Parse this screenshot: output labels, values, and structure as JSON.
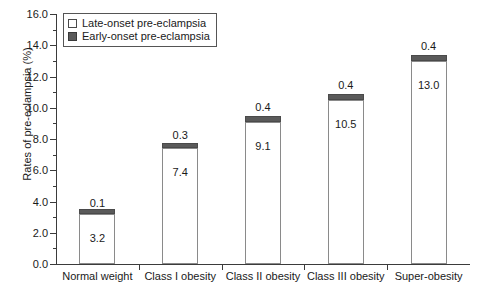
{
  "chart_data": {
    "type": "bar",
    "title": "",
    "xlabel": "",
    "ylabel": "Rates of pre-eclampsia (%)",
    "ylim": [
      0.0,
      16.0
    ],
    "ytick_step": 2.0,
    "yminor_step": 1.0,
    "grid": false,
    "stacked": true,
    "legend_position": "top-left",
    "categories": [
      "Normal weight",
      "Class I obesity",
      "Class II obesity",
      "Class III obesity",
      "Super-obesity"
    ],
    "ytick_labels": [
      "0.0",
      "2.0",
      "4.0",
      "6.0",
      "8.0",
      "10.0",
      "12.0",
      "14.0",
      "16.0"
    ],
    "ytick_values": [
      0.0,
      2.0,
      4.0,
      6.0,
      8.0,
      10.0,
      12.0,
      14.0,
      16.0
    ],
    "series": [
      {
        "name": "Late-onset pre-eclampsia",
        "color": "#ffffff",
        "values": [
          3.2,
          7.4,
          9.1,
          10.5,
          13.0
        ],
        "labels": [
          "3.2",
          "7.4",
          "9.1",
          "10.5",
          "13.0"
        ]
      },
      {
        "name": "Early-onset pre-eclampsia",
        "color": "#5a5a5a",
        "values": [
          0.1,
          0.3,
          0.4,
          0.4,
          0.4
        ],
        "labels": [
          "0.1",
          "0.3",
          "0.4",
          "0.4",
          "0.4"
        ]
      }
    ],
    "totals": [
      3.3,
      7.7,
      9.5,
      10.9,
      13.4
    ]
  },
  "legend": {
    "items": [
      {
        "label": "Late-onset pre-eclampsia",
        "swatch": "open-square"
      },
      {
        "label": "Early-onset pre-eclampsia",
        "swatch": "filled-square"
      }
    ]
  }
}
